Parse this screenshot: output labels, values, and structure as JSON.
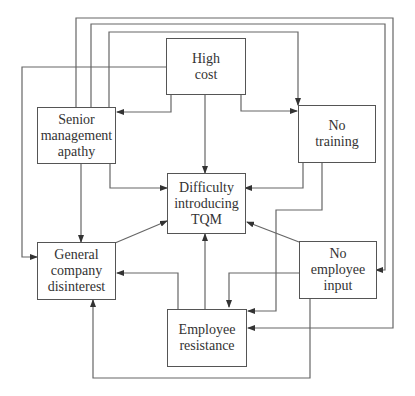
{
  "diagram": {
    "type": "cause-and-effect network",
    "nodes": {
      "high_cost": {
        "lines": [
          "High",
          "cost"
        ]
      },
      "senior_management_apathy": {
        "lines": [
          "Senior",
          "management",
          "apathy"
        ]
      },
      "no_training": {
        "lines": [
          "No",
          "training"
        ]
      },
      "difficulty_introducing_tqm": {
        "lines": [
          "Difficulty",
          "introducing",
          "TQM"
        ]
      },
      "general_company_disinterest": {
        "lines": [
          "General",
          "company",
          "disinterest"
        ]
      },
      "no_employee_input": {
        "lines": [
          "No",
          "employee",
          "input"
        ]
      },
      "employee_resistance": {
        "lines": [
          "Employee",
          "resistance"
        ]
      }
    },
    "edges": [
      {
        "from": "high_cost",
        "to": "senior_management_apathy"
      },
      {
        "from": "high_cost",
        "to": "no_training"
      },
      {
        "from": "high_cost",
        "to": "difficulty_introducing_tqm"
      },
      {
        "from": "high_cost",
        "to": "general_company_disinterest"
      },
      {
        "from": "senior_management_apathy",
        "to": "difficulty_introducing_tqm"
      },
      {
        "from": "senior_management_apathy",
        "to": "general_company_disinterest"
      },
      {
        "from": "senior_management_apathy",
        "to": "no_training"
      },
      {
        "from": "senior_management_apathy",
        "to": "no_employee_input"
      },
      {
        "from": "senior_management_apathy",
        "to": "employee_resistance"
      },
      {
        "from": "no_training",
        "to": "difficulty_introducing_tqm"
      },
      {
        "from": "no_training",
        "to": "employee_resistance"
      },
      {
        "from": "general_company_disinterest",
        "to": "difficulty_introducing_tqm"
      },
      {
        "from": "no_employee_input",
        "to": "difficulty_introducing_tqm"
      },
      {
        "from": "no_employee_input",
        "to": "employee_resistance"
      },
      {
        "from": "no_employee_input",
        "to": "general_company_disinterest"
      },
      {
        "from": "employee_resistance",
        "to": "difficulty_introducing_tqm"
      },
      {
        "from": "employee_resistance",
        "to": "general_company_disinterest"
      }
    ],
    "colors": {
      "line": "#555555",
      "text": "#333333",
      "background": "#ffffff"
    }
  }
}
